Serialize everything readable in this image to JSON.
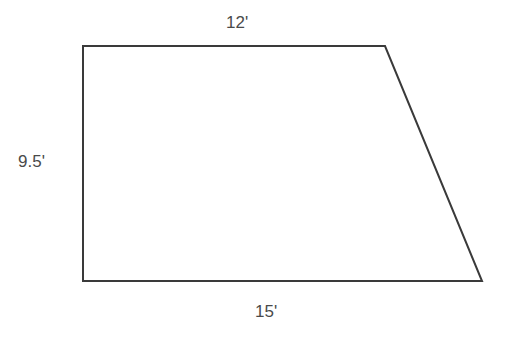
{
  "diagram": {
    "type": "trapezoid",
    "stroke_color": "#3a3a3a",
    "label_color": "#4a4a4a",
    "vertices": {
      "top_left": [
        83,
        46
      ],
      "top_right": [
        385,
        46
      ],
      "bottom_right": [
        482,
        281
      ],
      "bottom_left": [
        83,
        281
      ]
    },
    "labels": {
      "top": "12'",
      "left": "9.5'",
      "bottom": "15'"
    }
  }
}
